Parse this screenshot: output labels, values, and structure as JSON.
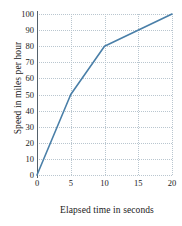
{
  "chart_data": {
    "type": "line",
    "title": "",
    "xlabel": "Elapsed time in seconds",
    "ylabel": "Speed in miles per hour",
    "xlim": [
      0,
      20
    ],
    "ylim": [
      0,
      100
    ],
    "grid": true,
    "legend": false,
    "xticks": [
      "0",
      "5",
      "10",
      "15",
      "20"
    ],
    "xtick_values": [
      0,
      5,
      10,
      15,
      20
    ],
    "yticks": [
      "0",
      "10",
      "20",
      "30",
      "40",
      "50",
      "60",
      "70",
      "80",
      "90",
      "100"
    ],
    "ytick_values": [
      0,
      10,
      20,
      30,
      40,
      50,
      60,
      70,
      80,
      90,
      100
    ],
    "series": [
      {
        "name": "speed",
        "color": "#4a7fa8",
        "x": [
          0,
          5,
          10,
          20
        ],
        "values": [
          0,
          50,
          80,
          100
        ]
      }
    ]
  }
}
